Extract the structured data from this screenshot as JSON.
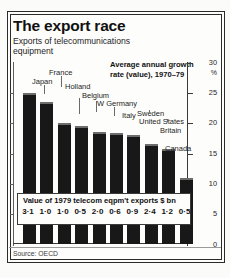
{
  "header": {
    "title": "The export race",
    "subtitle": "Exports of telecommunications equipment"
  },
  "annotation": "Average annual growth rate (value), 1970–79",
  "axis": {
    "unit": "%",
    "ticks": [
      "30",
      "25",
      "20",
      "15",
      "10",
      "5"
    ],
    "zero_label": "0"
  },
  "value_box": {
    "label": "Value of 1979 telecom eqpm't exports $ bn",
    "values": [
      "3·1",
      "1·0",
      "1·0",
      "0·5",
      "2·0",
      "0·6",
      "0·9",
      "2·4",
      "1·2",
      "0·5"
    ]
  },
  "source": "Source: OECD",
  "colors": {
    "bar": "#181818",
    "bar_highlight": "#6d6d6d",
    "rule": "#2b2b2b",
    "background": "#fdfdfc"
  },
  "chart_data": {
    "type": "bar",
    "title": "The export race",
    "subtitle": "Exports of telecommunications equipment",
    "annotation": "Average annual growth rate (value), 1970–79",
    "xlabel": "",
    "ylabel": "Average annual growth rate (value), 1970-79, %",
    "ylim": [
      0,
      30
    ],
    "yticks": [
      5,
      10,
      15,
      20,
      25,
      30
    ],
    "grid": false,
    "legend": "none",
    "categories": [
      "Japan",
      "France",
      "Holland",
      "Belgium",
      "W Germany",
      "Italy",
      "Sweden",
      "United States",
      "Britain",
      "Canada"
    ],
    "values": [
      25.0,
      23.5,
      20.0,
      19.5,
      18.5,
      18.4,
      18.0,
      16.6,
      15.8,
      11.0
    ],
    "secondary_series": {
      "name": "Value of 1979 telecom eqpm't exports $ bn",
      "values": [
        3.1,
        1.0,
        1.0,
        0.5,
        2.0,
        0.6,
        0.9,
        2.4,
        1.2,
        0.5
      ]
    },
    "source": "Source: OECD"
  },
  "labels": [
    {
      "name": "Japan",
      "cx": 29,
      "ly": 25,
      "lx": 31,
      "tx": 19,
      "ty": 18,
      "lh": 9
    },
    {
      "name": "France",
      "cx": 46,
      "ly": 16,
      "lx": 48,
      "tx": 36,
      "ty": 9,
      "lh": 11
    },
    {
      "name": "Holland",
      "cx": 64,
      "ly": 38,
      "lx": 66,
      "tx": 52,
      "ty": 23,
      "lh": 16
    },
    {
      "name": "Belgium",
      "cx": 81,
      "ly": 41,
      "lx": 83,
      "tx": 69,
      "ty": 32,
      "lh": 11
    },
    {
      "name": "W Germany",
      "cx": 99,
      "ly": 47,
      "lx": 101,
      "tx": 84,
      "ty": 40,
      "lh": 9
    },
    {
      "name": "Italy",
      "cx": 117,
      "ly": 47,
      "lx": 118,
      "tx": 109,
      "ty": 52,
      "lh": 0
    },
    {
      "name": "Sweden",
      "cx": 134,
      "ly": 50,
      "lx": 136,
      "tx": 124,
      "ty": 50,
      "lh": 2
    },
    {
      "name": "United States",
      "cx": 152,
      "ly": 59,
      "lx": 154,
      "tx": 126,
      "ty": 58,
      "lh": 3
    },
    {
      "name": "Britain",
      "cx": 169,
      "ly": 64,
      "lx": 171,
      "tx": 147,
      "ty": 67,
      "lh": 0
    },
    {
      "name": "Canada",
      "cx": 187,
      "ly": 94,
      "lx": 176,
      "tx": 152,
      "ty": 85,
      "lh": 0
    }
  ]
}
